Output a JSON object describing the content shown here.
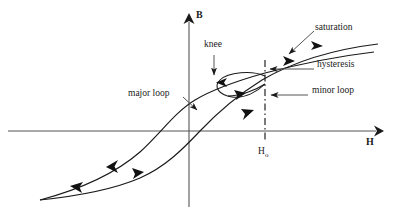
{
  "figure": {
    "type": "diagram",
    "background_color": "#ffffff",
    "line_color": "#1a1a1a",
    "axis_color": "#3a3a3a"
  },
  "axes": {
    "vertical": {
      "label": "B",
      "x": 189,
      "top_y": 13,
      "bottom_y": 207,
      "arrow": "up"
    },
    "horizontal": {
      "label": "H",
      "y": 131,
      "left_x": 8,
      "right_x": 383,
      "arrow": "right"
    }
  },
  "markers": {
    "h0": {
      "label": "H",
      "subscript": "o",
      "x": 265,
      "dash_top_y": 60,
      "dash_bottom_y": 142,
      "style": "dash-dot vertical line"
    }
  },
  "annotations": [
    {
      "id": "knee",
      "label": "knee",
      "text_x": 204,
      "text_y": 45,
      "leader": "vertical arrow pointing down to upper branch"
    },
    {
      "id": "saturation",
      "label": "saturation",
      "text_x": 315,
      "text_y": 28,
      "leader": "diagonal arrow pointing down-left to upper branch"
    },
    {
      "id": "hysteresis",
      "label": "hysteresis",
      "text_x": 317,
      "text_y": 65,
      "leader": "horizontal arrow pointing left to gap between branches"
    },
    {
      "id": "minor-loop",
      "label": "minor loop",
      "text_x": 312,
      "text_y": 91,
      "leader": "horizontal arrow pointing left to small loop"
    },
    {
      "id": "major-loop",
      "label": "major loop",
      "text_x": 128,
      "text_y": 94,
      "leader": "diagonal arrow pointing down-right to rising branch"
    }
  ],
  "curves": {
    "upper_branch": "descending branch of major hysteresis loop, saturating at upper right",
    "lower_branch": "ascending branch of major hysteresis loop, saturating at upper right",
    "minor_loop": "small ellipse straddling the ascending branch near H-sub-o",
    "direction_arrows": 6
  }
}
